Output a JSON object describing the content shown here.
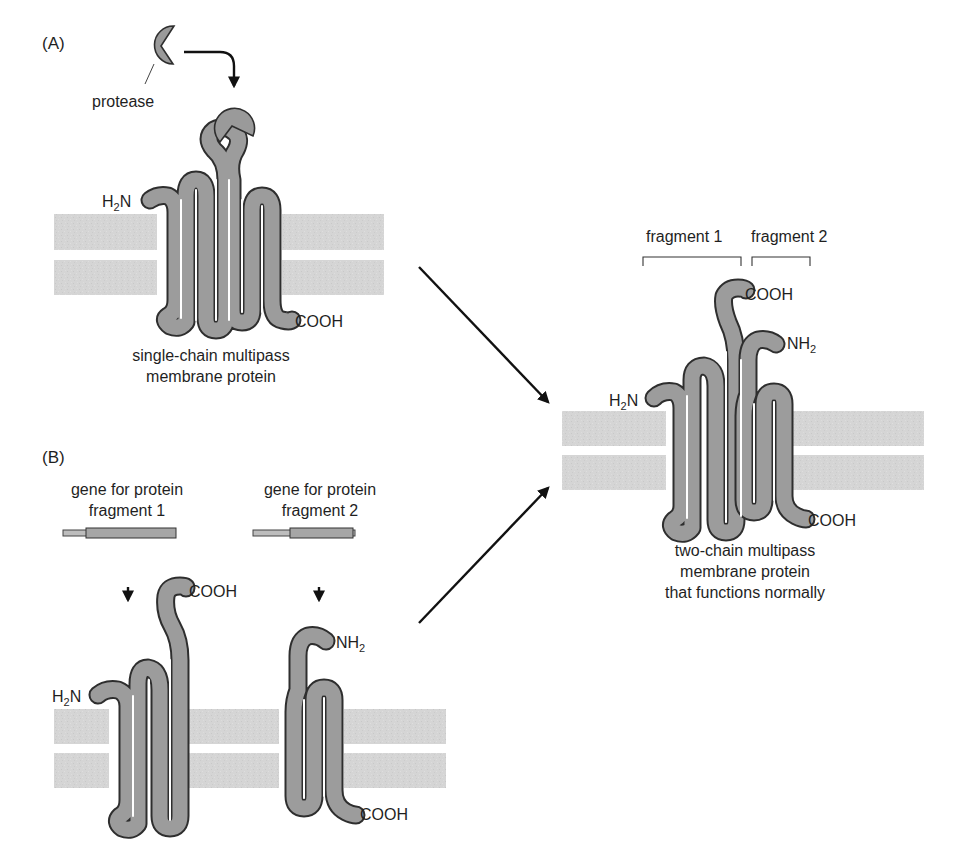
{
  "figure": {
    "panel_a": {
      "label": "(A)",
      "protease_label": "protease",
      "n_terminus": "H2N",
      "c_terminus": "COOH",
      "caption": [
        "single-chain multipass",
        "membrane protein"
      ]
    },
    "panel_b": {
      "label": "(B)",
      "gene_1_caption": [
        "gene for protein",
        "fragment 1"
      ],
      "gene_2_caption": [
        "gene for protein",
        "fragment 2"
      ],
      "fragment_1": {
        "n_terminus": "H2N",
        "c_terminus": "COOH"
      },
      "fragment_2": {
        "n_terminus": "NH2",
        "c_terminus": "COOH"
      }
    },
    "result": {
      "bracket_1_label": "fragment 1",
      "bracket_2_label": "fragment 2",
      "n_terminus_1": "H2N",
      "c_terminus_1": "COOH",
      "n_terminus_2": "NH2",
      "c_terminus_2": "COOH",
      "caption": [
        "two-chain multipass",
        "membrane protein",
        "that functions normally"
      ]
    },
    "colors": {
      "membrane": "#d4d4d4",
      "protein_fill": "#9c9c9c",
      "protein_outline": "#2e2e2e",
      "arrow": "#111111",
      "background": "#ffffff"
    }
  }
}
